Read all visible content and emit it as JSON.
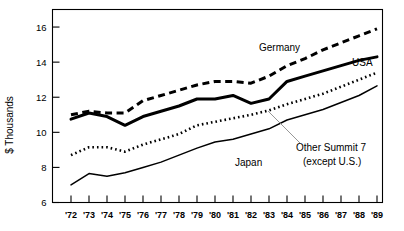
{
  "chart_data": {
    "type": "line",
    "title": "",
    "xlabel": "",
    "ylabel": "$ Thousands",
    "ylim": [
      6,
      17
    ],
    "yticks": [
      6,
      8,
      10,
      12,
      14,
      16
    ],
    "ytick_labels": [
      "6",
      "8",
      "10",
      "12",
      "14",
      "16"
    ],
    "grid": false,
    "legend": "inline-annotations",
    "categories": [
      "'72",
      "'73",
      "'74",
      "'75",
      "'76",
      "'77",
      "'78",
      "'79",
      "'80",
      "'81",
      "'82",
      "'83",
      "'84",
      "'85",
      "'86",
      "'87",
      "'88",
      "'89"
    ],
    "x": [
      1972,
      1973,
      1974,
      1975,
      1976,
      1977,
      1978,
      1979,
      1980,
      1981,
      1982,
      1983,
      1984,
      1985,
      1986,
      1987,
      1988,
      1989
    ],
    "series": [
      {
        "name": "Germany",
        "style": "dashed",
        "color": "#000000",
        "values": [
          11.0,
          11.2,
          11.1,
          11.1,
          11.8,
          12.1,
          12.4,
          12.7,
          12.9,
          12.9,
          12.8,
          13.2,
          13.8,
          14.2,
          14.7,
          15.1,
          15.5,
          15.9
        ]
      },
      {
        "name": "USA",
        "style": "solid-thick",
        "color": "#000000",
        "values": [
          10.75,
          11.1,
          10.9,
          10.4,
          10.9,
          11.2,
          11.5,
          11.9,
          11.9,
          12.1,
          11.65,
          11.9,
          12.9,
          13.2,
          13.5,
          13.8,
          14.1,
          14.3
        ]
      },
      {
        "name": "Other Summit 7 (except U.S.)",
        "style": "dotted",
        "color": "#000000",
        "values": [
          8.7,
          9.15,
          9.15,
          8.9,
          9.3,
          9.6,
          9.9,
          10.4,
          10.6,
          10.8,
          11.0,
          11.25,
          11.6,
          11.9,
          12.2,
          12.6,
          13.0,
          13.4
        ]
      },
      {
        "name": "Japan",
        "style": "solid-thin",
        "color": "#000000",
        "values": [
          7.0,
          7.65,
          7.5,
          7.7,
          8.0,
          8.3,
          8.7,
          9.1,
          9.45,
          9.6,
          9.9,
          10.2,
          10.7,
          11.0,
          11.3,
          11.7,
          12.1,
          12.65
        ]
      }
    ],
    "annotations": [
      {
        "name": "germany-label",
        "text": "Germany",
        "x": 259,
        "y": 51,
        "anchor": "start"
      },
      {
        "name": "usa-label",
        "text": "USA",
        "x": 352,
        "y": 66,
        "anchor": "start"
      },
      {
        "name": "japan-label",
        "text": "Japan",
        "x": 235,
        "y": 166,
        "anchor": "start"
      },
      {
        "name": "other-summit-label-line1",
        "text": "Other Summit 7",
        "x": 296,
        "y": 151,
        "anchor": "start"
      },
      {
        "name": "other-summit-label-line2",
        "text": "(except U.S.)",
        "x": 303,
        "y": 165,
        "anchor": "start"
      }
    ]
  },
  "axis": {
    "y_axis_title": "$ Thousands"
  }
}
